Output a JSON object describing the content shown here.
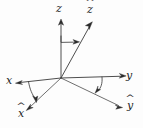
{
  "figure": {
    "background_color": "#fdfdfd",
    "ink_color": "#2b2b2b"
  },
  "labels": {
    "z": {
      "text": "z",
      "hat": ""
    },
    "z_hat": {
      "text": "z",
      "hat": "^"
    },
    "x": {
      "text": "x",
      "hat": ""
    },
    "x_hat": {
      "text": "x",
      "hat": "^"
    },
    "y": {
      "text": "y",
      "hat": ""
    },
    "y_hat": {
      "text": "y",
      "hat": "^"
    }
  },
  "axes": [
    {
      "name": "z-axis",
      "label": "z",
      "from": [
        61,
        78
      ],
      "to": [
        61,
        20
      ],
      "style": "original"
    },
    {
      "name": "z-hat-axis",
      "label": "ẑ",
      "from": [
        61,
        78
      ],
      "to": [
        92,
        23
      ],
      "style": "rotated"
    },
    {
      "name": "x-axis",
      "label": "x",
      "from": [
        61,
        78
      ],
      "to": [
        16,
        83
      ],
      "style": "original"
    },
    {
      "name": "x-hat-axis",
      "label": "x̂",
      "from": [
        61,
        78
      ],
      "to": [
        27,
        110
      ],
      "style": "rotated"
    },
    {
      "name": "y-axis",
      "label": "y",
      "from": [
        61,
        78
      ],
      "to": [
        126,
        76
      ],
      "style": "original"
    },
    {
      "name": "y-hat-axis",
      "label": "ŷ",
      "from": [
        61,
        78
      ],
      "to": [
        122,
        108
      ],
      "style": "rotated"
    }
  ],
  "rotation_arrows": [
    {
      "name": "rotation-arc-z",
      "from_axis": "z",
      "to_axis": "z-hat",
      "direction": "right"
    },
    {
      "name": "rotation-arc-x",
      "from_axis": "x",
      "to_axis": "x-hat",
      "direction": "down"
    },
    {
      "name": "rotation-arc-y",
      "from_axis": "y",
      "to_axis": "y-hat",
      "direction": "down-left"
    }
  ],
  "origin": {
    "x": 61,
    "y": 78
  }
}
